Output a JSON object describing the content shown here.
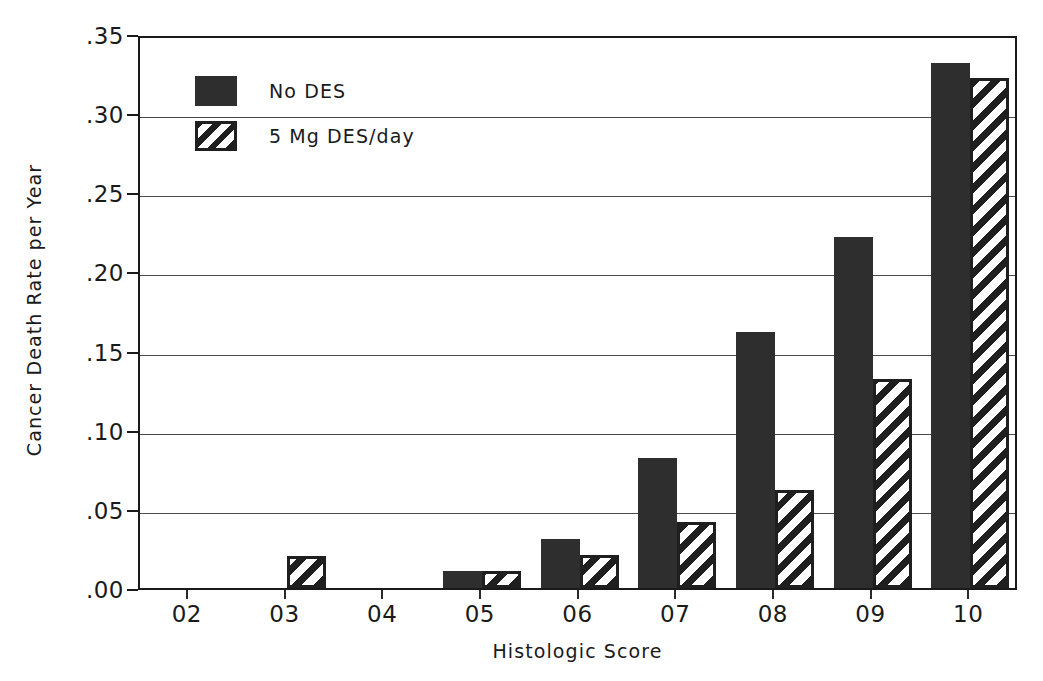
{
  "chart_data": {
    "type": "bar",
    "title": "",
    "xlabel": "Histologic Score",
    "ylabel": "Cancer Death Rate per Year",
    "categories": [
      "02",
      "03",
      "04",
      "05",
      "06",
      "07",
      "08",
      "09",
      "10"
    ],
    "series": [
      {
        "name": "No DES",
        "fill": "solid",
        "color": "#2e2e2e",
        "values": [
          null,
          null,
          null,
          0.011,
          0.031,
          0.082,
          0.162,
          0.222,
          0.332
        ]
      },
      {
        "name": "5 Mg DES/day",
        "fill": "hatch",
        "color": "#1f1f1f",
        "values": [
          null,
          0.02,
          null,
          0.011,
          0.021,
          0.042,
          0.062,
          0.132,
          0.322
        ]
      }
    ],
    "ylim": [
      0.0,
      0.35
    ],
    "yticks": [
      0.0,
      0.05,
      0.1,
      0.15,
      0.2,
      0.25,
      0.3,
      0.35
    ],
    "ytick_labels": [
      ".00",
      ".05",
      ".10",
      ".15",
      ".20",
      ".25",
      ".30",
      ".35"
    ],
    "grid": true,
    "grid_axis": "y",
    "legend_position": "upper-left"
  },
  "legend": {
    "entries": [
      {
        "label": "No DES",
        "fill": "solid"
      },
      {
        "label": "5 Mg DES/day",
        "fill": "hatch"
      }
    ]
  }
}
